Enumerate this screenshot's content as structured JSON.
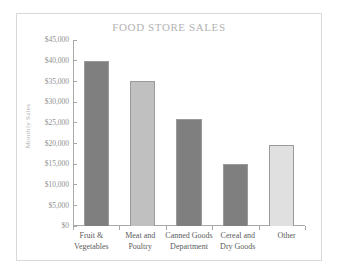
{
  "chart_data": {
    "type": "bar",
    "title": "FOOD STORE SALES",
    "xlabel": "",
    "ylabel": "Monthly Sales",
    "categories": [
      "Fruit & Vegetables",
      "Meat and Poultry",
      "Canned Goods Department",
      "Cereal and Dry Goods",
      "Other"
    ],
    "category_lines": [
      {
        "line1": "Fruit &",
        "line2": "Vegetables"
      },
      {
        "line1": "Meat and",
        "line2": "Poultry"
      },
      {
        "line1": "Canned Goods",
        "line2": "Department"
      },
      {
        "line1": "Cereal and",
        "line2": "Dry Goods"
      },
      {
        "line1": "Other",
        "line2": ""
      }
    ],
    "values": [
      40000,
      35000,
      26000,
      15000,
      19500
    ],
    "bar_colors": [
      "#7f7f7f",
      "#c0c0c0",
      "#7f7f7f",
      "#7f7f7f",
      "#e0e0e0"
    ],
    "ylim": [
      0,
      45000
    ],
    "ytick_values": [
      45000,
      40000,
      35000,
      30000,
      25000,
      20000,
      15000,
      10000,
      5000,
      0
    ],
    "ytick_labels": [
      "$45,000",
      "$40,000",
      "$35,000",
      "$30,000",
      "$25,000",
      "$20,000",
      "$15,000",
      "$10,000",
      "$5,000",
      "$0"
    ],
    "grid": false,
    "legend": false,
    "title_color": "#b3b3b3",
    "axis_color": "#a8a8a8",
    "tick_label_color": "#8f8f8f"
  }
}
